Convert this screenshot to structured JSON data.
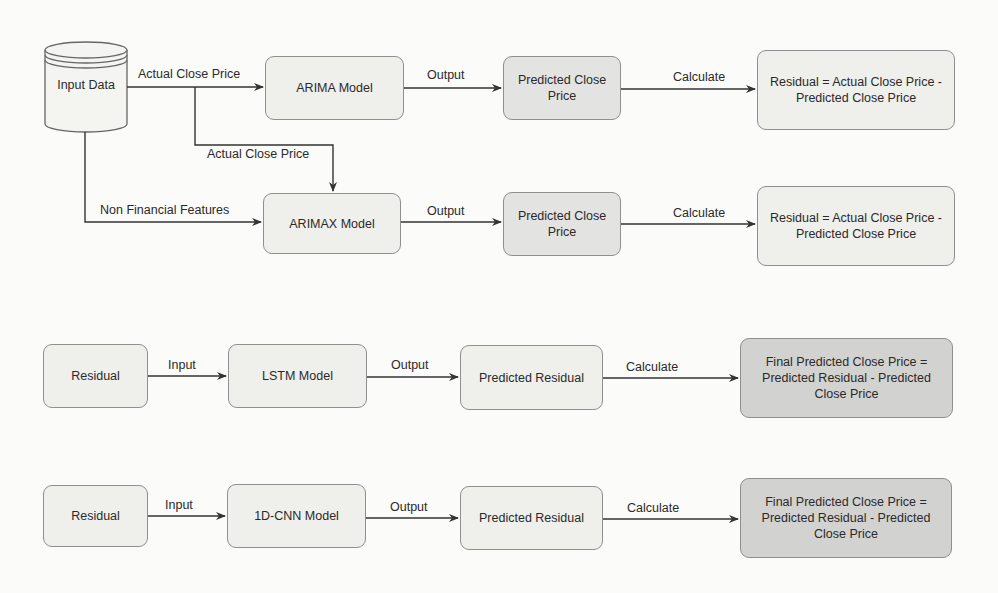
{
  "diagram": {
    "source": {
      "label": "Input Data",
      "shape": "cylinder"
    },
    "rows": [
      {
        "id": "arima",
        "model": "ARIMA Model",
        "input_edge": "Actual Close Price",
        "output_edge": "Output",
        "prediction": "Predicted Close Price",
        "calc_edge": "Calculate",
        "result": "Residual = Actual Close Price - Predicted Close Price"
      },
      {
        "id": "arimax",
        "model": "ARIMAX Model",
        "input_edge_top": "Actual Close Price",
        "input_edge_left": "Non Financial Features",
        "output_edge": "Output",
        "prediction": "Predicted Close Price",
        "calc_edge": "Calculate",
        "result": "Residual = Actual Close Price - Predicted Close Price"
      },
      {
        "id": "lstm",
        "source": "Residual",
        "input_edge": "Input",
        "model": "LSTM Model",
        "output_edge": "Output",
        "prediction": "Predicted Residual",
        "calc_edge": "Calculate",
        "result": "Final Predicted Close Price = Predicted Residual - Predicted Close Price"
      },
      {
        "id": "cnn",
        "source": "Residual",
        "input_edge": "Input",
        "model": "1D-CNN Model",
        "output_edge": "Output",
        "prediction": "Predicted Residual",
        "calc_edge": "Calculate",
        "result": "Final Predicted Close Price = Predicted Residual - Predicted Close Price"
      }
    ],
    "colors": {
      "background": "#fbfbf9",
      "box_light": "#efefec",
      "box_mid": "#e3e3e1",
      "box_dark": "#d2d2d0",
      "stroke": "#333333"
    }
  }
}
